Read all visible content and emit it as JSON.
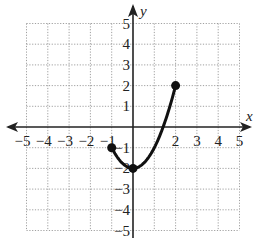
{
  "chart_data": {
    "type": "line",
    "title": "",
    "xlabel": "x",
    "ylabel": "y",
    "xlim": [
      -5,
      5
    ],
    "ylim": [
      -5,
      5
    ],
    "grid": true,
    "x_ticks": [
      "-5",
      "-4",
      "-3",
      "-2",
      "-1",
      "2",
      "3",
      "4",
      "5"
    ],
    "y_ticks": [
      "5",
      "4",
      "3",
      "2",
      "1",
      "-1",
      "-2",
      "-3",
      "-4",
      "-5"
    ],
    "series": [
      {
        "name": "curve",
        "function": "y = x^2 - 2",
        "domain": [
          -1,
          2
        ],
        "points": [
          [
            -1,
            -1
          ],
          [
            -0.5,
            -1.75
          ],
          [
            0,
            -2
          ],
          [
            0.5,
            -1.75
          ],
          [
            1,
            -1
          ],
          [
            1.5,
            0.25
          ],
          [
            2,
            2
          ]
        ],
        "endpoints": [
          [
            -1,
            -1
          ],
          [
            2,
            2
          ]
        ],
        "marked_points": [
          [
            -1,
            -1
          ],
          [
            0,
            -2
          ],
          [
            2,
            2
          ]
        ],
        "endpoint_style": "closed"
      }
    ]
  }
}
